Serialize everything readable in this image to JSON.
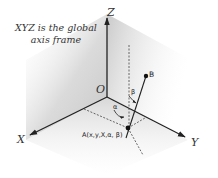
{
  "caption": {
    "line1": "XYZ is the global",
    "line2": "axis frame"
  },
  "axes": {
    "x_label": "X",
    "y_label": "Y",
    "z_label": "Z",
    "origin_label": "O"
  },
  "points": {
    "a_label": "A(x,y,X,α, β)",
    "b_label": "B"
  },
  "angles": {
    "alpha": "α",
    "beta": "β"
  },
  "colors": {
    "axis": "#222222",
    "plane_shade": "#c8c8c8",
    "dashed": "#444444"
  }
}
